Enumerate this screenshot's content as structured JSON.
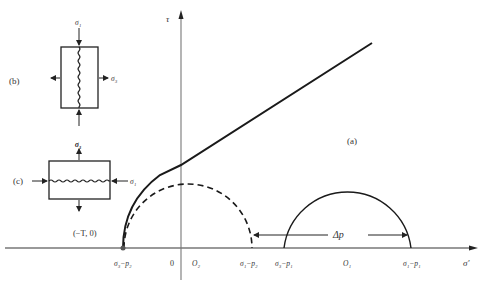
{
  "figure": {
    "panel_labels": {
      "a": "(a)",
      "b": "(b)",
      "c": "(c)"
    },
    "axes": {
      "x_label": "σ′",
      "y_label": "τ",
      "origin_label": "0"
    },
    "axis_ticks": {
      "s3_minus_p2_left": "σ₃−p₂",
      "O2": "O₂",
      "s1_minus_p2": "σ₁−p₂",
      "s3_minus_p1": "σ₃−p₁",
      "O1": "O₁",
      "s1_minus_p1": "σ₁−p₁"
    },
    "point_label": "(−T, 0)",
    "delta_p_label": "Δp",
    "inset_b": {
      "top_load": "σ₁",
      "bottom_load": "σ₁",
      "side_load": "σ₃"
    },
    "inset_c": {
      "top_load": "σ₃",
      "side_load": "σ₁"
    },
    "colors": {
      "line": "#1a1a1a",
      "axis": "#555555",
      "text": "#333333"
    }
  }
}
